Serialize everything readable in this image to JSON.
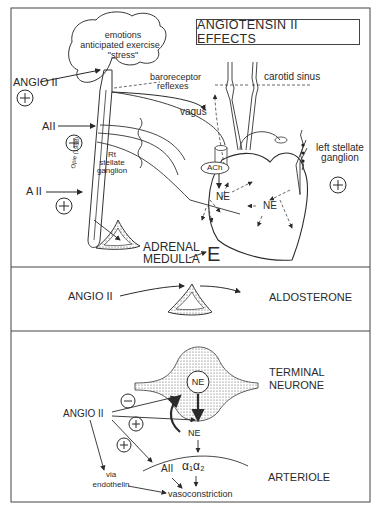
{
  "title": "ANGIOTENSIN II EFFECTS",
  "panel_top": {
    "brain_text": [
      "emotions",
      "anticipated exercise",
      "\"stress\""
    ],
    "angio_label": "ANGIO II",
    "a2_upper": "AII",
    "a2_lower": "A II",
    "plus_symbol": "+",
    "baroreceptor": [
      "baroreceptor",
      "reflexes"
    ],
    "carotid_sinus": "carotid sinus",
    "vagus": "vagus",
    "ach": "ACh",
    "ne_left": "NE",
    "ne_right": "NE",
    "rt_stellate": [
      "Rt",
      "stellate",
      "ganglion"
    ],
    "left_stellate": [
      "left stellate",
      "ganglion"
    ],
    "citation": "Opie (1998)",
    "adrenal": [
      "ADRENAL",
      "MEDULLA"
    ],
    "epinephrine": "E"
  },
  "panel_middle": {
    "angio_label": "ANGIO II",
    "output": "ALDOSTERONE"
  },
  "panel_bottom": {
    "terminal": [
      "TERMINAL",
      "NEURONE"
    ],
    "ne_vesicle": "NE",
    "ne_released": "NE",
    "angio_label": "ANGIO II",
    "minus_symbol": "−",
    "plus_symbol": "+",
    "a2": "AII",
    "alpha": "α₁α₂",
    "arteriole": "ARTERIOLE",
    "via": [
      "via",
      "endothelin"
    ],
    "vasoconstriction": "vasoconstriction"
  }
}
